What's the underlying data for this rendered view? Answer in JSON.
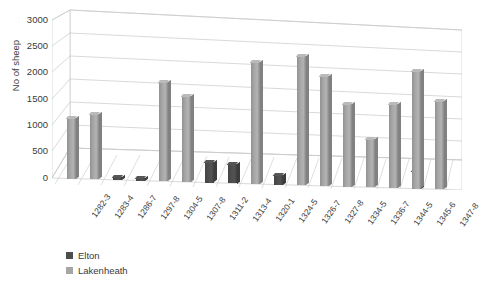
{
  "chart_data": {
    "type": "bar",
    "title": "",
    "xlabel": "",
    "ylabel": "No of sheep",
    "ylim": [
      0,
      3000
    ],
    "ytick_labels": [
      "3000",
      "2500",
      "2000",
      "1500",
      "1000",
      "500",
      "0"
    ],
    "yticks": [
      3000,
      2500,
      2000,
      1500,
      1000,
      500,
      0
    ],
    "grid": true,
    "three_d": true,
    "legend_position": "bottom-left",
    "categories": [
      "1282-3",
      "1283-4",
      "1286-7",
      "1297-8",
      "1304-5",
      "1307-8",
      "1311-2",
      "1313-4",
      "1320-1",
      "1324-5",
      "1326-7",
      "1327-8",
      "1334-5",
      "1336-7",
      "1344-5",
      "1345-6",
      "1347-8"
    ],
    "series": [
      {
        "name": "Elton",
        "color": "#4d4d4d",
        "values": [
          null,
          null,
          60,
          50,
          null,
          null,
          380,
          370,
          null,
          180,
          null,
          null,
          null,
          null,
          null,
          330,
          null
        ]
      },
      {
        "name": "Lakenheath",
        "color": "#a6a6a6",
        "values": [
          1150,
          1230,
          null,
          null,
          1880,
          1620,
          null,
          null,
          2300,
          null,
          2430,
          2070,
          1560,
          900,
          1570,
          2200,
          1650
        ]
      }
    ]
  },
  "legend": {
    "items": [
      {
        "label": "Elton",
        "color": "#4d4d4d"
      },
      {
        "label": "Lakenheath",
        "color": "#a6a6a6"
      }
    ]
  }
}
